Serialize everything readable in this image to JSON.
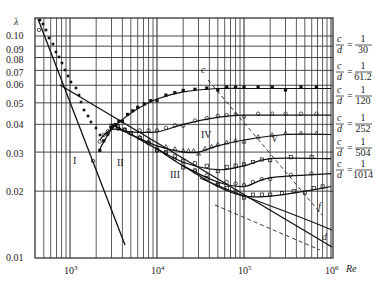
{
  "chart_data": {
    "type": "line",
    "title": "",
    "xlabel": "Re",
    "ylabel": "λ",
    "xscale": "log",
    "yscale": "log",
    "xlim": [
      400,
      1000000
    ],
    "ylim": [
      0.01,
      0.12
    ],
    "grid": true,
    "x_tick_labels": [
      "10³",
      "10⁴",
      "10⁵",
      "10⁶"
    ],
    "x_ticks": [
      1000,
      10000,
      100000,
      1000000
    ],
    "y_tick_labels": [
      "0.10",
      "0.09",
      "0.08",
      "0.07",
      "0.06",
      "0.05",
      "0.04",
      "0.03",
      "0.02",
      "0.01"
    ],
    "y_ticks": [
      0.1,
      0.09,
      0.08,
      0.07,
      0.06,
      0.05,
      0.04,
      0.03,
      0.02,
      0.01
    ],
    "region_labels": [
      "I",
      "II",
      "III",
      "IV",
      "V"
    ],
    "line_labels": [
      "c",
      "d",
      "f"
    ],
    "series": [
      {
        "name": "c/d = 1/30",
        "legend": {
          "num": "1",
          "den": "30"
        },
        "x": [
          2200,
          3000,
          4000,
          6000,
          10000,
          20000,
          50000,
          100000,
          300000,
          1000000
        ],
        "values": [
          0.031,
          0.038,
          0.042,
          0.047,
          0.052,
          0.056,
          0.058,
          0.058,
          0.058,
          0.058
        ]
      },
      {
        "name": "c/d = 1/61.2",
        "legend": {
          "num": "1",
          "den": "61.2"
        },
        "x": [
          2200,
          3000,
          5000,
          10000,
          20000,
          50000,
          100000,
          300000,
          1000000
        ],
        "values": [
          0.034,
          0.038,
          0.037,
          0.037,
          0.04,
          0.043,
          0.044,
          0.044,
          0.044
        ]
      },
      {
        "name": "c/d = 1/120",
        "legend": {
          "num": "1",
          "den": "120"
        },
        "x": [
          3000,
          5000,
          10000,
          20000,
          30000,
          50000,
          100000,
          300000,
          1000000
        ],
        "values": [
          0.04,
          0.036,
          0.032,
          0.03,
          0.03,
          0.032,
          0.034,
          0.036,
          0.036
        ]
      },
      {
        "name": "c/d = 1/252",
        "legend": {
          "num": "1",
          "den": "252"
        },
        "x": [
          3000,
          5000,
          10000,
          20000,
          50000,
          100000,
          200000,
          1000000
        ],
        "values": [
          0.04,
          0.036,
          0.031,
          0.027,
          0.025,
          0.026,
          0.028,
          0.028
        ]
      },
      {
        "name": "c/d = 1/504",
        "legend": {
          "num": "1",
          "den": "504"
        },
        "x": [
          10000,
          20000,
          50000,
          100000,
          200000,
          1000000
        ],
        "values": [
          0.031,
          0.026,
          0.022,
          0.021,
          0.023,
          0.024
        ]
      },
      {
        "name": "c/d = 1/1014",
        "legend": {
          "num": "1",
          "den": "1014"
        },
        "x": [
          20000,
          50000,
          100000,
          200000,
          500000,
          1000000
        ],
        "values": [
          0.026,
          0.021,
          0.019,
          0.019,
          0.02,
          0.021
        ]
      },
      {
        "name": "Laminar (I)",
        "x": [
          400,
          1000,
          2000,
          4300
        ],
        "values": [
          0.16,
          0.064,
          0.032,
          0.0125
        ]
      },
      {
        "name": "Blasius (II)",
        "x": [
          1000,
          10000,
          100000,
          1000000
        ],
        "values": [
          0.056,
          0.032,
          0.018,
          0.011
        ]
      }
    ]
  },
  "axis": {
    "y_symbol": "λ",
    "x_symbol": "Re",
    "x_ticks": [
      {
        "base": "10",
        "exp": "3"
      },
      {
        "base": "10",
        "exp": "4"
      },
      {
        "base": "10",
        "exp": "5"
      },
      {
        "base": "10",
        "exp": "6"
      }
    ],
    "y_ticks": [
      "0.10",
      "0.09",
      "0.08",
      "0.07",
      "0.06",
      "0.05",
      "0.04",
      "0.03",
      "0.02",
      "0.01"
    ]
  },
  "legend": {
    "c": "c",
    "d": "d",
    "eq": "=",
    "items": [
      {
        "num": "1",
        "den": "30"
      },
      {
        "num": "1",
        "den": "61.2"
      },
      {
        "num": "1",
        "den": "120"
      },
      {
        "num": "1",
        "den": "252"
      },
      {
        "num": "1",
        "den": "504"
      },
      {
        "num": "1",
        "den": "1014"
      }
    ]
  },
  "regions": {
    "r1": "I",
    "r2": "II",
    "r3": "III",
    "r4": "IV",
    "r5": "V"
  },
  "annotations": {
    "c": "c",
    "d": "d",
    "f": "f"
  }
}
